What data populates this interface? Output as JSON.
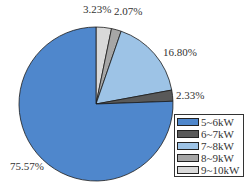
{
  "chart_data": {
    "type": "pie",
    "title": "",
    "start_angle_deg": 0,
    "direction": "clockwise",
    "slices": [
      {
        "label": "9~10kW",
        "value": 3.23,
        "display": "3.23%",
        "color": "#d9d9d9"
      },
      {
        "label": "8~9kW",
        "value": 2.07,
        "display": "2.07%",
        "color": "#a6a6a6"
      },
      {
        "label": "7~8kW",
        "value": 16.8,
        "display": "16.80%",
        "color": "#9dc3e6"
      },
      {
        "label": "6~7kW",
        "value": 2.33,
        "display": "2.33%",
        "color": "#595959"
      },
      {
        "label": "5~6kW",
        "value": 75.57,
        "display": "75.57%",
        "color": "#4f87cc"
      }
    ],
    "legend": {
      "position": "lower right",
      "entries": [
        "5~6kW",
        "6~7kW",
        "7~8kW",
        "8~9kW",
        "9~10kW"
      ]
    }
  },
  "labels": {
    "s0": "3.23%",
    "s1": "2.07%",
    "s2": "16.80%",
    "s3": "2.33%",
    "s4": "75.57%"
  },
  "legend": [
    {
      "label": "5~6kW",
      "color": "#4f87cc"
    },
    {
      "label": "6~7kW",
      "color": "#595959"
    },
    {
      "label": "7~8kW",
      "color": "#9dc3e6"
    },
    {
      "label": "8~9kW",
      "color": "#a6a6a6"
    },
    {
      "label": "9~10kW",
      "color": "#d9d9d9"
    }
  ]
}
